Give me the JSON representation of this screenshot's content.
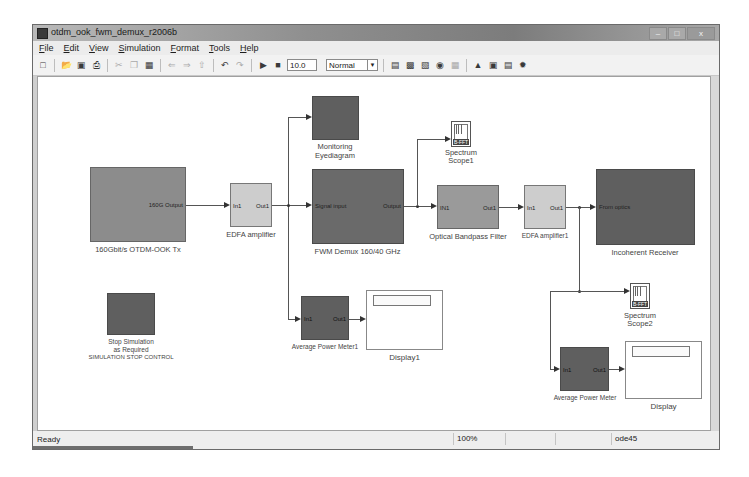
{
  "window": {
    "title": "otdm_ook_fwm_demux_r2006b",
    "controls": {
      "minimize": "–",
      "maximize": "□",
      "close": "x"
    }
  },
  "menubar": {
    "items": [
      "File",
      "Edit",
      "View",
      "Simulation",
      "Format",
      "Tools",
      "Help"
    ]
  },
  "toolbar": {
    "icons": [
      "new-icon",
      "open-icon",
      "save-icon",
      "print-icon",
      "cut-icon",
      "copy-icon",
      "paste-icon",
      "back-icon",
      "forward-icon",
      "up-icon",
      "undo-icon",
      "redo-icon",
      "start-icon",
      "stop-icon"
    ],
    "stop_time": "10.0",
    "sim_mode": "Normal",
    "right_icons": [
      "build-icon",
      "library-icon",
      "model-explorer-icon",
      "debug-icon",
      "grid-icon",
      "browser-icon",
      "fit-icon",
      "properties-icon",
      "settings-icon"
    ]
  },
  "diagram": {
    "blocks": {
      "tx": {
        "label": "160Gbit/s OTDM-OOK Tx",
        "out_port": "160G Output"
      },
      "edfa1": {
        "label": "EDFA amplifier",
        "in_port": "In1",
        "out_port": "Out1"
      },
      "eye": {
        "label_line1": "Monitoring",
        "label_line2": "Eyediagram"
      },
      "fwm": {
        "label": "FWM Demux 160/40 GHz",
        "in_port": "Signal input",
        "out_port": "Output"
      },
      "scope1": {
        "label_line1": "Spectrum",
        "label_line2": "Scope1",
        "tag": "B-FFT"
      },
      "obpf": {
        "label": "Optical Bandpass Filter",
        "in_port": "IN1",
        "out_port": "Out1"
      },
      "edfa2": {
        "label": "EDFA amplifier1",
        "in_port": "In1",
        "out_port": "Out1"
      },
      "rx": {
        "label": "Incoherent Receiver",
        "in_port": "From optics"
      },
      "scope2": {
        "label_line1": "Spectrum",
        "label_line2": "Scope2",
        "tag": "B-FFT"
      },
      "stop": {
        "label_line1": "Stop Simulation",
        "label_line2": "as Required",
        "label_line3": "SIMULATION STOP CONTROL"
      },
      "apm1": {
        "label": "Average Power Meter1",
        "in_port": "In1",
        "out_port": "Out1"
      },
      "display1": {
        "label": "Display1"
      },
      "apm2": {
        "label": "Average Power Meter",
        "in_port": "In1",
        "out_port": "Out1"
      },
      "display2": {
        "label": "Display"
      }
    }
  },
  "statusbar": {
    "status": "Ready",
    "zoom": "100%",
    "cell2": "",
    "cell3": "",
    "solver": "ode45"
  }
}
